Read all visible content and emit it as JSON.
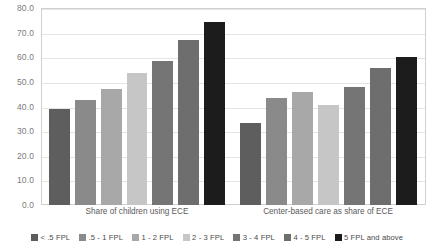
{
  "chart_data": {
    "type": "bar",
    "title": "",
    "xlabel": "",
    "ylabel": "",
    "ylim": [
      0,
      80
    ],
    "ytick_labels": [
      "80.0",
      "70.0",
      "60.0",
      "50.0",
      "40.0",
      "30.0",
      "20.0",
      "10.0",
      "0.0"
    ],
    "ytick_values": [
      80,
      70,
      60,
      50,
      40,
      30,
      20,
      10,
      0
    ],
    "grid": true,
    "legend_position": "bottom",
    "categories": [
      "Share of children using ECE",
      "Center-based care as share of ECE"
    ],
    "series": [
      {
        "name": "< .5 FPL",
        "color": "#5e5e5e",
        "values": [
          39.0,
          33.5
        ]
      },
      {
        "name": ".5 - 1 FPL",
        "color": "#8a8a8a",
        "values": [
          42.5,
          43.5
        ]
      },
      {
        "name": "1 - 2 FPL",
        "color": "#a8a8a8",
        "values": [
          47.0,
          46.0
        ]
      },
      {
        "name": "2 - 3 FPL",
        "color": "#c6c6c6",
        "values": [
          53.5,
          40.5
        ]
      },
      {
        "name": "3 - 4 FPL",
        "color": "#757575",
        "values": [
          58.5,
          48.0
        ]
      },
      {
        "name": "4 - 5 FPL",
        "color": "#6e6e6e",
        "values": [
          67.0,
          55.5
        ]
      },
      {
        "name": "5 FPL and above",
        "color": "#1c1c1c",
        "values": [
          74.5,
          60.0
        ]
      }
    ]
  }
}
